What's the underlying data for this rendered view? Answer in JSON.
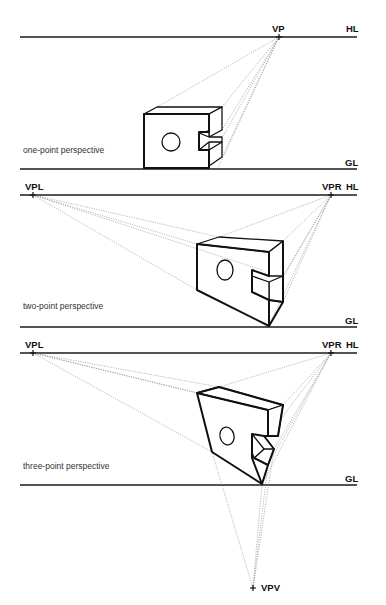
{
  "diagram": {
    "panels": [
      {
        "caption": "one-point perspective",
        "horizon_label": "HL",
        "ground_label": "GL",
        "vanishing_points": [
          {
            "label": "VP"
          }
        ]
      },
      {
        "caption": "two-point perspective",
        "horizon_label": "HL",
        "ground_label": "GL",
        "vanishing_points": [
          {
            "label": "VPL"
          },
          {
            "label": "VPR"
          }
        ]
      },
      {
        "caption": "three-point perspective",
        "horizon_label": "HL",
        "ground_label": "GL",
        "vanishing_points": [
          {
            "label": "VPL"
          },
          {
            "label": "VPR"
          },
          {
            "label": "VPV"
          }
        ]
      }
    ],
    "colors": {
      "line": "#111111",
      "guide": "#8a8a8a",
      "background": "#ffffff"
    }
  }
}
